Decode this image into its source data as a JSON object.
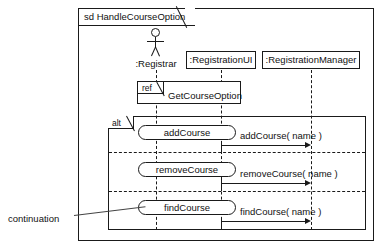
{
  "diagram": {
    "kind": "uml-sequence-diagram",
    "frame": {
      "keyword": "sd",
      "label": "sd HandleCourseOption",
      "name": "HandleCourseOption"
    },
    "actor": {
      "name": ":Registrar",
      "icon": "actor-stick-figure"
    },
    "lifelines": [
      {
        "id": "registrar",
        "label": ":Registrar",
        "type": "actor"
      },
      {
        "id": "registrationui",
        "label": ":RegistrationUI",
        "type": "object"
      },
      {
        "id": "registrationmanager",
        "label": ":RegistrationManager",
        "type": "object"
      }
    ],
    "ref_fragment": {
      "keyword": "ref",
      "label": "GetCourseOption"
    },
    "alt_fragment": {
      "keyword": "alt",
      "operands": [
        {
          "continuation": "addCourse",
          "message": "addCourse( name )",
          "from": "registrationui",
          "to": "registrationmanager"
        },
        {
          "continuation": "removeCourse",
          "message": "removeCourse( name )",
          "from": "registrationui",
          "to": "registrationmanager"
        },
        {
          "continuation": "findCourse",
          "message": "findCourse( name )",
          "from": "registrationui",
          "to": "registrationmanager"
        }
      ]
    },
    "annotation": {
      "label": "continuation"
    },
    "colors": {
      "stroke": "#1a1a1a",
      "background": "#ffffff",
      "text": "#111111"
    }
  }
}
